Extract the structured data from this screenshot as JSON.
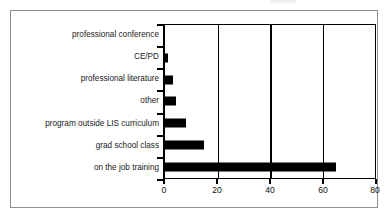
{
  "chart_data": {
    "type": "bar",
    "orientation": "horizontal",
    "title": "",
    "xlabel": "",
    "ylabel": "",
    "categories": [
      "professional conference",
      "CE/PD",
      "professional literature",
      "other",
      "program outside LIS curriculum",
      "grad school class",
      "on the job training"
    ],
    "values": [
      0,
      1,
      3,
      4,
      8,
      15,
      65
    ],
    "xlim": [
      0,
      80
    ],
    "xticks": [
      0,
      20,
      40,
      60,
      80
    ],
    "xtick_labels": [
      "0",
      "20",
      "40",
      "60",
      "80"
    ],
    "grid": true,
    "grid_axis": "x",
    "legend": false,
    "bar_color": "#000000",
    "background_color": "#ffffff",
    "frame_color": "#8d8d8d"
  }
}
